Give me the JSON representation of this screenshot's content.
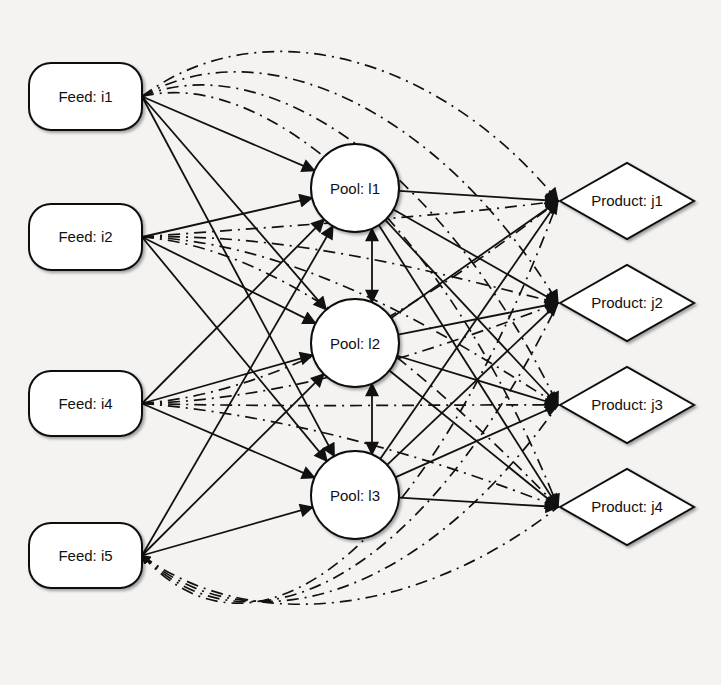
{
  "diagram": {
    "feeds": [
      {
        "id": "i1",
        "label": "Feed: i1",
        "x": 29,
        "y": 63,
        "w": 113,
        "h": 67
      },
      {
        "id": "i2",
        "label": "Feed: i2",
        "x": 29,
        "y": 204,
        "w": 113,
        "h": 66
      },
      {
        "id": "i4",
        "label": "Feed: i4",
        "x": 29,
        "y": 371,
        "w": 113,
        "h": 65
      },
      {
        "id": "i5",
        "label": "Feed: i5",
        "x": 29,
        "y": 523,
        "w": 113,
        "h": 65
      }
    ],
    "pools": [
      {
        "id": "l1",
        "label": "Pool: l1",
        "cx": 355,
        "cy": 188,
        "r": 44
      },
      {
        "id": "l2",
        "label": "Pool: l2",
        "cx": 355,
        "cy": 343,
        "r": 44
      },
      {
        "id": "l3",
        "label": "Pool: l3",
        "cx": 355,
        "cy": 495,
        "r": 44
      }
    ],
    "products": [
      {
        "id": "j1",
        "label": "Product: j1",
        "cx": 627,
        "cy": 201,
        "hw": 67,
        "hh": 38
      },
      {
        "id": "j2",
        "label": "Product: j2",
        "cx": 627,
        "cy": 303,
        "hw": 67,
        "hh": 38
      },
      {
        "id": "j3",
        "label": "Product: j3",
        "cx": 627,
        "cy": 405,
        "hw": 67,
        "hh": 38
      },
      {
        "id": "j4",
        "label": "Product: j4",
        "cx": 627,
        "cy": 507,
        "hw": 67,
        "hh": 38
      }
    ],
    "edge_styles": {
      "feed_to_pool": "solid-arrow",
      "pool_to_product": "solid-arrow",
      "pool_to_pool": "solid-bidirectional",
      "feed_to_product_bypass": "dash-dot-arrow"
    },
    "colors": {
      "background": "#f4f3f1",
      "stroke": "#111111",
      "node_fill": "#ffffff"
    }
  }
}
